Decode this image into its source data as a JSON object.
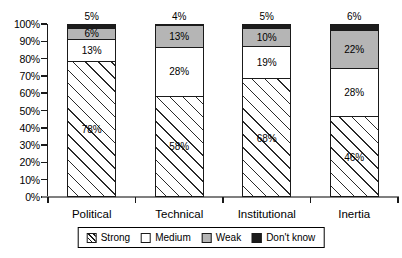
{
  "chart_data": {
    "type": "bar",
    "variant": "stacked-percent",
    "title": "",
    "xlabel": "",
    "ylabel": "",
    "categories": [
      "Political",
      "Technical",
      "Institutional",
      "Inertia"
    ],
    "series": [
      {
        "name": "Strong",
        "fill": "hatch",
        "values": [
          78,
          58,
          68,
          46
        ]
      },
      {
        "name": "Medium",
        "fill": "white",
        "values": [
          13,
          28,
          19,
          28
        ]
      },
      {
        "name": "Weak",
        "fill": "gray",
        "values": [
          6,
          13,
          10,
          22
        ]
      },
      {
        "name": "Don't know",
        "fill": "black",
        "values": [
          5,
          4,
          5,
          6
        ]
      }
    ],
    "value_suffix": "%",
    "data_labels": {
      "Strong": [
        "78%",
        "58%",
        "68%",
        "46%"
      ],
      "Medium": [
        "13%",
        "28%",
        "19%",
        "28%"
      ],
      "Weak": [
        "6%",
        "13%",
        "10%",
        "22%"
      ],
      "Don't know": [
        "5%",
        "4%",
        "5%",
        "6%"
      ]
    },
    "y_axis": {
      "min": 0,
      "max": 100,
      "tick_step": 10,
      "tick_labels": [
        "0%",
        "10%",
        "20%",
        "30%",
        "40%",
        "50%",
        "60%",
        "70%",
        "80%",
        "90%",
        "100%"
      ]
    },
    "legend": {
      "position": "bottom",
      "boxed": true,
      "entries": [
        "Strong",
        "Medium",
        "Weak",
        "Don't know"
      ]
    },
    "grid": false
  },
  "colors": {
    "background": "#ffffff",
    "bar_hatch_line": "#2a2a2a",
    "bar_white": "#ffffff",
    "bar_gray": "#b5b5b5",
    "bar_black": "#1c1c1c",
    "axis_y": "#1a1a1a",
    "axis_x": "#7f7f7f",
    "text": "#000000"
  }
}
